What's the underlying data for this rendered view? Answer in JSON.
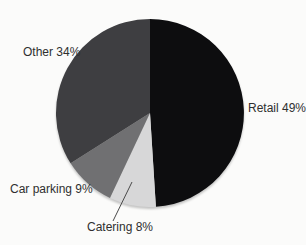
{
  "chart_data": {
    "type": "pie",
    "title": "",
    "categories": [
      "Retail",
      "Catering",
      "Car parking",
      "Other"
    ],
    "values": [
      49,
      8,
      9,
      34
    ],
    "unit": "percent",
    "colors": [
      "#0d0d0f",
      "#d7d7d8",
      "#707072",
      "#3e3e41"
    ],
    "start_angle_deg": 0,
    "direction": "clockwise",
    "legend_position": "none",
    "grid": false,
    "labels": {
      "retail": "Retail 49%",
      "catering": "Catering 8%",
      "car_parking": "Car parking 9%",
      "other": "Other 34%"
    }
  }
}
